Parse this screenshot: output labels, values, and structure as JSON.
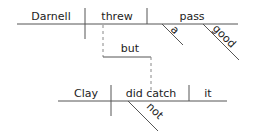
{
  "diagram": {
    "type": "Reed-Kellogg sentence diagram",
    "clause1": {
      "subject": "Darnell",
      "verb": "threw",
      "object": "pass",
      "object_modifiers": [
        "a",
        "good"
      ]
    },
    "conjunction": "but",
    "clause2": {
      "subject": "Clay",
      "verb": "did catch",
      "object": "it",
      "verb_modifiers": [
        "not"
      ]
    }
  }
}
